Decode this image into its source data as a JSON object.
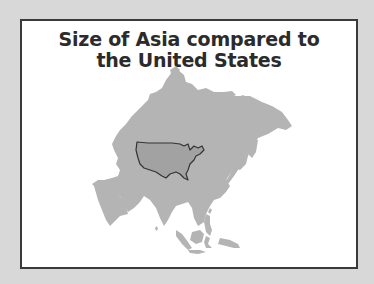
{
  "map": {
    "title_line1": "Size of Asia compared to",
    "title_line2": "the United States",
    "layers": [
      {
        "name": "Asia",
        "fill": "#b4b4b4"
      },
      {
        "name": "United States (overlay)",
        "fill": "#a2a2a2",
        "stroke": "#333333"
      }
    ],
    "colors": {
      "background": "#d8d8d8",
      "panel": "#ffffff",
      "border": "#3a3a3a",
      "title": "#2b2b2b"
    }
  }
}
